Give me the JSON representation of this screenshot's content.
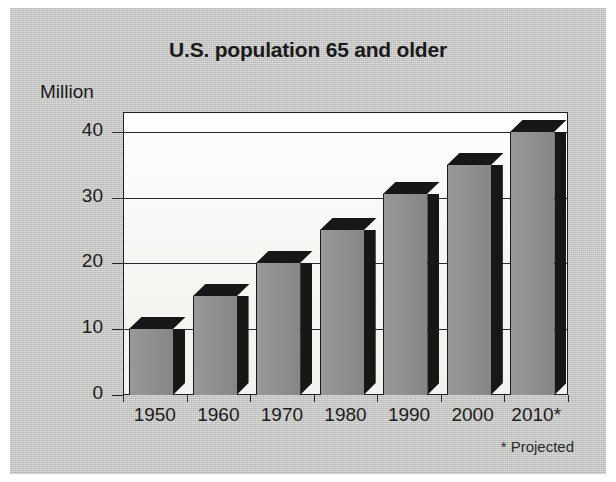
{
  "chart_data": {
    "type": "bar",
    "title": "U.S. population 65 and older",
    "xlabel": "",
    "ylabel": "Million",
    "ylim": [
      0,
      43
    ],
    "categories": [
      "1950",
      "1960",
      "1970",
      "1980",
      "1990",
      "2000",
      "2010*"
    ],
    "values": [
      10,
      15,
      20,
      25,
      30.5,
      35,
      40
    ],
    "yticks": [
      "0",
      "10",
      "20",
      "30",
      "40"
    ],
    "ytick_values": [
      0,
      10,
      20,
      30,
      40
    ],
    "grid": "horizontal",
    "legend": "none",
    "annotation": "* Projected",
    "series": [
      {
        "name": "U.S. population 65 and older (millions)",
        "values": [
          10,
          15,
          20,
          25,
          30.5,
          35,
          40
        ]
      }
    ]
  },
  "colors": {
    "plate_background": "#c9c9c7",
    "plot_background": "#f7f7f5",
    "bar_face": "#8d8d8b",
    "bar_shadow": "#171717",
    "axis": "#2a2a2a",
    "text": "#1c1c1c",
    "page": "#ffffff"
  }
}
